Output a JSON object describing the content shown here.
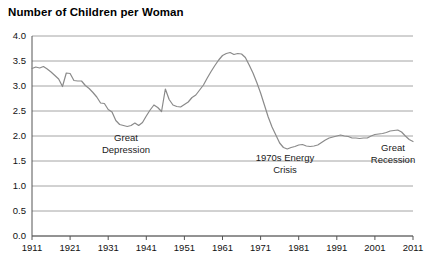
{
  "chart_data": {
    "type": "line",
    "title": "Number of Children per Woman",
    "xlabel": "",
    "ylabel": "",
    "grid": true,
    "legend": "none",
    "xlim": [
      1911,
      2011
    ],
    "ylim": [
      0.0,
      4.0
    ],
    "ytick_labels": [
      "4.0",
      "3.5",
      "3.0",
      "2.5",
      "2.0",
      "1.5",
      "1.0",
      "0.5",
      "0.0"
    ],
    "ytick_values": [
      4.0,
      3.5,
      3.0,
      2.5,
      2.0,
      1.5,
      1.0,
      0.5,
      0.0
    ],
    "xtick_labels": [
      "1911",
      "1921",
      "1931",
      "1941",
      "1951",
      "1961",
      "1971",
      "1981",
      "1991",
      "2001",
      "2011"
    ],
    "xtick_values": [
      1911,
      1921,
      1931,
      1941,
      1951,
      1961,
      1971,
      1981,
      1991,
      2001,
      2011
    ],
    "series": [
      {
        "name": "Total fertility rate",
        "color": "#8a8a8a",
        "x": [
          1911,
          1912,
          1913,
          1914,
          1915,
          1916,
          1917,
          1918,
          1919,
          1920,
          1921,
          1922,
          1923,
          1924,
          1925,
          1926,
          1927,
          1928,
          1929,
          1930,
          1931,
          1932,
          1933,
          1934,
          1935,
          1936,
          1937,
          1938,
          1939,
          1940,
          1941,
          1942,
          1943,
          1944,
          1945,
          1946,
          1947,
          1948,
          1949,
          1950,
          1951,
          1952,
          1953,
          1954,
          1955,
          1956,
          1957,
          1958,
          1959,
          1960,
          1961,
          1962,
          1963,
          1964,
          1965,
          1966,
          1967,
          1968,
          1969,
          1970,
          1971,
          1972,
          1973,
          1974,
          1975,
          1976,
          1977,
          1978,
          1979,
          1980,
          1981,
          1982,
          1983,
          1984,
          1985,
          1986,
          1987,
          1988,
          1989,
          1990,
          1991,
          1992,
          1993,
          1994,
          1995,
          1996,
          1997,
          1998,
          1999,
          2000,
          2001,
          2002,
          2003,
          2004,
          2005,
          2006,
          2007,
          2008,
          2009,
          2010,
          2011
        ],
        "y": [
          3.35,
          3.38,
          3.36,
          3.39,
          3.34,
          3.28,
          3.21,
          3.14,
          2.99,
          3.26,
          3.25,
          3.11,
          3.1,
          3.1,
          3.01,
          2.95,
          2.87,
          2.78,
          2.66,
          2.65,
          2.53,
          2.48,
          2.31,
          2.23,
          2.21,
          2.19,
          2.21,
          2.26,
          2.21,
          2.27,
          2.4,
          2.52,
          2.62,
          2.57,
          2.49,
          2.94,
          2.73,
          2.62,
          2.59,
          2.58,
          2.63,
          2.68,
          2.77,
          2.82,
          2.92,
          3.02,
          3.16,
          3.29,
          3.41,
          3.52,
          3.61,
          3.65,
          3.67,
          3.63,
          3.65,
          3.64,
          3.57,
          3.42,
          3.26,
          3.07,
          2.86,
          2.62,
          2.38,
          2.18,
          2.02,
          1.86,
          1.77,
          1.74,
          1.77,
          1.79,
          1.82,
          1.83,
          1.8,
          1.79,
          1.8,
          1.82,
          1.87,
          1.92,
          1.96,
          1.98,
          2.0,
          2.02,
          2.0,
          1.99,
          1.96,
          1.96,
          1.95,
          1.96,
          1.96,
          2.0,
          2.03,
          2.04,
          2.05,
          2.07,
          2.1,
          2.11,
          2.12,
          2.08,
          2.0,
          1.93,
          1.89
        ]
      }
    ],
    "annotations": [
      {
        "id": "great-depression",
        "lines": [
          "Great",
          "Depression"
        ],
        "x_px": 126,
        "y_px": 141
      },
      {
        "id": "energy-crisis",
        "lines": [
          "1970s Energy",
          "Crisis"
        ],
        "x_px": 285,
        "y_px": 161
      },
      {
        "id": "great-recession",
        "lines": [
          "Great",
          "Recession"
        ],
        "x_px": 393,
        "y_px": 151
      }
    ]
  }
}
